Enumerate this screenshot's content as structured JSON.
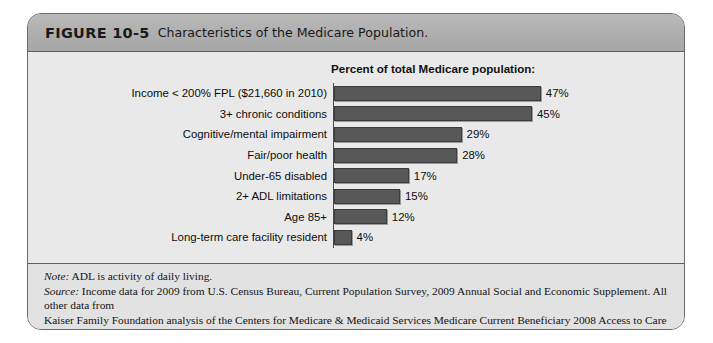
{
  "figure": {
    "number": "FIGURE 10-5",
    "caption": "Characteristics of the Medicare Population."
  },
  "chart_data": {
    "type": "bar",
    "orientation": "horizontal",
    "title": "Percent of total Medicare population:",
    "xlabel": "",
    "ylabel": "",
    "xlim": [
      0,
      50
    ],
    "grid": false,
    "legend": null,
    "bar_color": "#585858",
    "background_color": "#e9e9e9",
    "categories": [
      "Income < 200% FPL ($21,660 in 2010)",
      "3+ chronic conditions",
      "Cognitive/mental impairment",
      "Fair/poor health",
      "Under-65 disabled",
      "2+ ADL limitations",
      "Age 85+",
      "Long-term care facility resident"
    ],
    "values": [
      47,
      45,
      29,
      28,
      17,
      15,
      12,
      4
    ],
    "value_labels": [
      "47%",
      "45%",
      "29%",
      "28%",
      "17%",
      "15%",
      "12%",
      "4%"
    ]
  },
  "footnotes": {
    "note_tag": "Note:",
    "note_text": " ADL is activity of daily living.",
    "source_tag": "Source:",
    "source_text_line1": " Income data for 2009 from U.S. Census Bureau, Current Population Survey, 2009 Annual Social and Economic Supplement. All other data from",
    "source_text_line2": "Kaiser Family Foundation analysis of the Centers for Medicare & Medicaid Services Medicare Current Beneficiary 2008 Access to Care file."
  }
}
